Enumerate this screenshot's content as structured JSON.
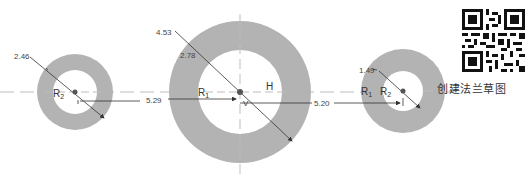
{
  "colors": {
    "ring_fill": "#b3b3b3",
    "hole_fill": "#ffffff",
    "line": "#333333",
    "centerline": "#bdbdbd",
    "text": "#444444"
  },
  "circles": [
    {
      "name": "left",
      "cx": 75,
      "cy": 92,
      "outer_r": 38,
      "inner_r": 22,
      "diameter_label": "2.46",
      "radius_labels": [
        {
          "text": "R",
          "sub": "2",
          "x": 53,
          "y": 97
        }
      ]
    },
    {
      "name": "middle",
      "cx": 240,
      "cy": 92,
      "outer_r": 71,
      "inner_r": 42,
      "diameter_label": "4.53",
      "inner_diameter_label": "2.78",
      "radius_labels": [
        {
          "text": "R",
          "sub": "1",
          "x": 198,
          "y": 96
        }
      ],
      "constraint_labels": {
        "horizontal": "H",
        "vertical": "V"
      }
    },
    {
      "name": "right",
      "cx": 403,
      "cy": 91,
      "outer_r": 42,
      "inner_r": 20,
      "diameter_label": "1.49",
      "radius_labels": [
        {
          "text": "R",
          "sub": "1",
          "x": 361,
          "y": 95
        },
        {
          "text": "R",
          "sub": "2",
          "x": 380,
          "y": 95
        }
      ]
    }
  ],
  "dimensions": {
    "left_to_middle": "5.29",
    "middle_to_right": "5.20"
  },
  "caption": "创建法兰草图"
}
